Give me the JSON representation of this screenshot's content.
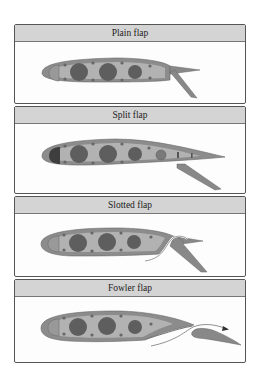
{
  "figure": {
    "panels": [
      {
        "id": "plain",
        "title": "Plain flap"
      },
      {
        "id": "split",
        "title": "Split flap"
      },
      {
        "id": "slotted",
        "title": "Slotted flap"
      },
      {
        "id": "fowler",
        "title": "Fowler flap"
      }
    ]
  },
  "colors": {
    "header_bg": "#d4d4d4",
    "border": "#555555",
    "airfoil_outer": "#8c8c8c",
    "airfoil_inner": "#b2b2b2",
    "circle_dark": "#5e5e5e",
    "flap": "#888888"
  }
}
